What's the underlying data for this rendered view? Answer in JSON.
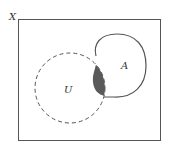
{
  "diagram": {
    "type": "venn",
    "universe_label": "X",
    "sets": [
      {
        "label": "U",
        "style": "dashed"
      },
      {
        "label": "A",
        "style": "solid"
      }
    ],
    "shaded_region": "U ∩ A",
    "colors": {
      "stroke": "#555555",
      "shade": "#5a5a5a",
      "background": "#ffffff"
    }
  }
}
